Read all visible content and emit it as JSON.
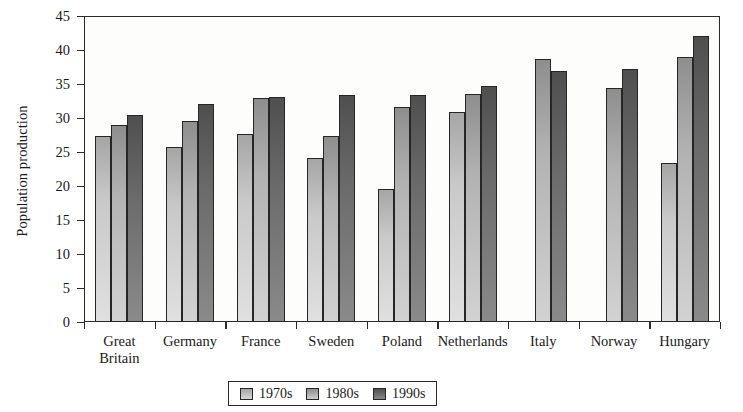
{
  "chart_data": {
    "type": "bar",
    "title": "",
    "subtitle": "",
    "xlabel": "",
    "ylabel": "Population production",
    "ylim": [
      0,
      45
    ],
    "yticks": [
      0,
      5,
      10,
      15,
      20,
      25,
      30,
      35,
      40,
      45
    ],
    "grid": false,
    "legend_position": "bottom",
    "categories": [
      "Great\nBritain",
      "Germany",
      "France",
      "Sweden",
      "Poland",
      "Netherlands",
      "Italy",
      "Norway",
      "Hungary"
    ],
    "series": [
      {
        "name": "1970s",
        "color": "#c9c9c9",
        "values": [
          27.4,
          25.7,
          27.7,
          24.1,
          19.5,
          30.9,
          null,
          null,
          23.4
        ]
      },
      {
        "name": "1980s",
        "color": "#b2b2b2",
        "values": [
          28.9,
          29.6,
          32.9,
          27.4,
          31.6,
          33.5,
          38.7,
          34.4,
          39.0
        ]
      },
      {
        "name": "1990s",
        "color": "#6b6b6b",
        "values": [
          30.5,
          32.1,
          33.1,
          33.4,
          33.4,
          34.7,
          36.9,
          37.2,
          42.1
        ]
      }
    ]
  },
  "legend": {
    "items": [
      {
        "label": "1970s"
      },
      {
        "label": "1980s"
      },
      {
        "label": "1990s"
      }
    ]
  }
}
